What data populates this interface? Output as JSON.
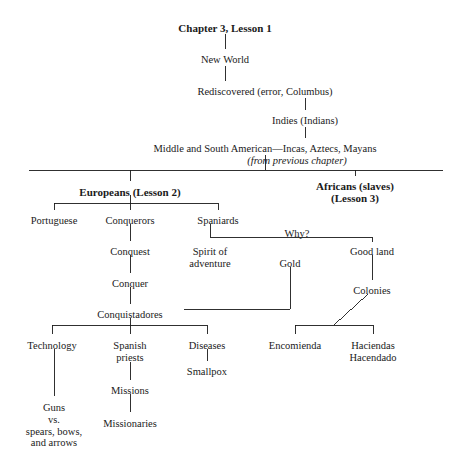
{
  "document": {
    "type": "hierarchical-outline-diagram",
    "title": "Chapter 3, Lesson 1",
    "ink_color": "#1a1a1a",
    "background_color": "#ffffff"
  },
  "nodes": [
    {
      "id": "title",
      "label": "Chapter 3, Lesson 1",
      "style": "bold",
      "x": 225,
      "y": 22
    },
    {
      "id": "new-world",
      "label": "New World",
      "style": "plain",
      "x": 225,
      "y": 54
    },
    {
      "id": "rediscovered",
      "label": "Rediscovered (error, Columbus)",
      "style": "plain",
      "x": 265,
      "y": 86
    },
    {
      "id": "indies",
      "label": "Indies (Indians)",
      "style": "plain",
      "x": 305,
      "y": 115
    },
    {
      "id": "middle-south",
      "label": "Middle and South American—Incas, Aztecs, Mayans",
      "style": "plain",
      "x": 265,
      "y": 143
    },
    {
      "id": "from-prev",
      "label": "(from previous chapter)",
      "style": "italic",
      "x": 297,
      "y": 155
    },
    {
      "id": "europeans",
      "label": "Europeans (Lesson 2)",
      "style": "bold",
      "x": 130,
      "y": 186
    },
    {
      "id": "africans",
      "label": "Africans (slaves)\n(Lesson 3)",
      "style": "bold",
      "x": 355,
      "y": 180
    },
    {
      "id": "portuguese",
      "label": "Portuguese",
      "style": "plain",
      "x": 54,
      "y": 215
    },
    {
      "id": "conquerors",
      "label": "Conquerors",
      "style": "plain",
      "x": 130,
      "y": 215
    },
    {
      "id": "spaniards",
      "label": "Spaniards",
      "style": "plain",
      "x": 218,
      "y": 215
    },
    {
      "id": "why",
      "label": "Why?",
      "style": "plain",
      "x": 297,
      "y": 228
    },
    {
      "id": "spirit",
      "label": "Spirit of\nadventure",
      "style": "plain",
      "x": 210,
      "y": 246
    },
    {
      "id": "gold",
      "label": "Gold",
      "style": "plain",
      "x": 290,
      "y": 258
    },
    {
      "id": "good-land",
      "label": "Good land",
      "style": "plain",
      "x": 372,
      "y": 246
    },
    {
      "id": "conquest",
      "label": "Conquest",
      "style": "plain",
      "x": 130,
      "y": 246
    },
    {
      "id": "colonies",
      "label": "Colonies",
      "style": "plain",
      "x": 372,
      "y": 285
    },
    {
      "id": "conquer",
      "label": "Conquer",
      "style": "plain",
      "x": 130,
      "y": 278
    },
    {
      "id": "conquistadores",
      "label": "Conquistadores",
      "style": "plain",
      "x": 130,
      "y": 309
    },
    {
      "id": "technology",
      "label": "Technology",
      "style": "plain",
      "x": 52,
      "y": 340
    },
    {
      "id": "spanish-priests",
      "label": "Spanish\npriests",
      "style": "plain",
      "x": 130,
      "y": 340
    },
    {
      "id": "diseases",
      "label": "Diseases",
      "style": "plain",
      "x": 207,
      "y": 340
    },
    {
      "id": "smallpox",
      "label": "Smallpox",
      "style": "plain",
      "x": 207,
      "y": 366
    },
    {
      "id": "encomienda",
      "label": "Encomienda",
      "style": "plain",
      "x": 295,
      "y": 340
    },
    {
      "id": "haciendas",
      "label": "Haciendas\nHacendado",
      "style": "plain",
      "x": 373,
      "y": 340
    },
    {
      "id": "missions",
      "label": "Missions",
      "style": "plain",
      "x": 130,
      "y": 385
    },
    {
      "id": "missionaries",
      "label": "Missionaries",
      "style": "plain",
      "x": 130,
      "y": 418
    },
    {
      "id": "guns-vs",
      "label": "Guns\nvs.\nspears, bows,\nand arrows",
      "style": "plain",
      "x": 54,
      "y": 402
    }
  ],
  "edges": [
    {
      "from": "title",
      "to": "new-world",
      "kind": "vertical",
      "points": "225,34 225,49"
    },
    {
      "from": "new-world",
      "to": "rediscovered",
      "kind": "vertical",
      "points": "225,66 225,81"
    },
    {
      "from": "rediscovered",
      "to": "indies",
      "kind": "vertical",
      "points": "305,98 305,110"
    },
    {
      "from": "indies",
      "to": "middle-south",
      "kind": "vertical",
      "points": "305,127 305,138"
    },
    {
      "from": "middle-south",
      "to": "main-bar",
      "kind": "vertical",
      "points": "265,155 265,170"
    },
    {
      "from": "main-bar",
      "to": "spread",
      "kind": "horizontal",
      "points": "29,170 443,170"
    },
    {
      "from": "main-bar",
      "to": "europeans",
      "kind": "vertical",
      "points": "130,170 130,181"
    },
    {
      "from": "main-bar",
      "to": "africans",
      "kind": "vertical",
      "points": "355,170 355,176"
    },
    {
      "from": "europeans",
      "to": "euro-bar",
      "kind": "vertical",
      "points": "130,195 130,203"
    },
    {
      "from": "euro-bar",
      "to": "spread",
      "kind": "horizontal",
      "points": "54,203 218,203"
    },
    {
      "from": "euro-bar",
      "to": "portuguese",
      "kind": "vertical",
      "points": "54,203 54,210"
    },
    {
      "from": "euro-bar",
      "to": "conquerors",
      "kind": "vertical",
      "points": "130,203 130,210"
    },
    {
      "from": "euro-bar",
      "to": "spaniards",
      "kind": "vertical",
      "points": "218,203 218,210"
    },
    {
      "from": "spaniards",
      "to": "why-bar",
      "kind": "vertical",
      "points": "210,224 210,237"
    },
    {
      "from": "why-bar",
      "to": "spread",
      "kind": "horizontal",
      "points": "210,237 372,237"
    },
    {
      "from": "why-bar",
      "to": "good-land",
      "kind": "vertical",
      "points": "372,237 372,242"
    },
    {
      "from": "conquerors",
      "to": "conquest",
      "kind": "vertical",
      "points": "130,224 130,241"
    },
    {
      "from": "conquest",
      "to": "conquer",
      "kind": "vertical",
      "points": "130,255 130,273"
    },
    {
      "from": "conquer",
      "to": "conquistadores",
      "kind": "vertical",
      "points": "130,287 130,304"
    },
    {
      "from": "gold",
      "to": "conquistadores",
      "kind": "elbow",
      "points": "290,267 290,309 184,309"
    },
    {
      "from": "good-land",
      "to": "colonies",
      "kind": "vertical",
      "points": "372,255 372,280"
    },
    {
      "from": "colonies",
      "to": "enc-bar",
      "kind": "diagonal",
      "points": "368,294 334,325"
    },
    {
      "from": "enc-bar",
      "to": "spread",
      "kind": "horizontal",
      "points": "295,325 373,325"
    },
    {
      "from": "enc-bar",
      "to": "encomienda",
      "kind": "vertical",
      "points": "295,325 295,334"
    },
    {
      "from": "enc-bar",
      "to": "haciendas",
      "kind": "vertical",
      "points": "373,325 373,334"
    },
    {
      "from": "conquistadores",
      "to": "conq-bar",
      "kind": "vertical",
      "points": "130,318 130,325"
    },
    {
      "from": "conq-bar",
      "to": "spread",
      "kind": "horizontal",
      "points": "52,325 207,325"
    },
    {
      "from": "conq-bar",
      "to": "technology",
      "kind": "vertical",
      "points": "52,325 52,334"
    },
    {
      "from": "conq-bar",
      "to": "spanish-priests",
      "kind": "vertical",
      "points": "130,325 130,334"
    },
    {
      "from": "conq-bar",
      "to": "diseases",
      "kind": "vertical",
      "points": "207,325 207,334"
    },
    {
      "from": "diseases",
      "to": "smallpox",
      "kind": "vertical",
      "points": "207,349 207,361"
    },
    {
      "from": "spanish-priests",
      "to": "missions",
      "kind": "vertical",
      "points": "130,362 130,380"
    },
    {
      "from": "missions",
      "to": "missionaries",
      "kind": "vertical",
      "points": "130,394 130,412"
    },
    {
      "from": "technology",
      "to": "guns-vs",
      "kind": "vertical",
      "points": "54,349 54,396"
    }
  ]
}
